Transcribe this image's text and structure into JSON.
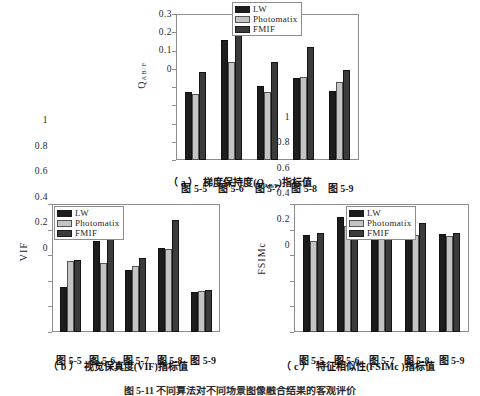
{
  "figure": {
    "bottom_caption": "图 5-11   不同算法对不同场景图像融合结果的客观评价"
  },
  "series": [
    {
      "name": "LW",
      "color": "#1d1d1d"
    },
    {
      "name": "Photomatix",
      "color": "#c4c4c4"
    },
    {
      "name": "FMIF",
      "color": "#3b3b3b"
    }
  ],
  "categories": [
    "图 5-5",
    "图 5-6",
    "图 5-7",
    "图 5-8",
    "图 5-9"
  ],
  "chart_data": [
    {
      "type": "bar",
      "id": "a",
      "panel_label": "（ a ）",
      "caption": "梯度保持度(Q AB/F )指标值",
      "caption_plain": "（ a ）  梯度保持度(Q_AB/F)指标值",
      "ylabel": "Q",
      "ylabel_sub": "AB/F",
      "xlabel": "",
      "ylim": [
        0,
        0.8
      ],
      "yticks": [
        0,
        0.1,
        0.2,
        0.3,
        0.4,
        0.5,
        0.6,
        0.7,
        0.8
      ],
      "ytick_labels": [
        "0",
        "0.1",
        "0.2",
        "0.3",
        "0.4",
        "0.5",
        "0.6",
        "0.7",
        "0.8"
      ],
      "grid": false,
      "legend_position": "top-right",
      "categories": [
        "图 5-5",
        "图 5-6",
        "图 5-7",
        "图 5-8",
        "图 5-9"
      ],
      "series": [
        {
          "name": "LW",
          "values": [
            0.375,
            0.655,
            0.405,
            0.45,
            0.38
          ]
        },
        {
          "name": "Photomatix",
          "values": [
            0.363,
            0.538,
            0.373,
            0.455,
            0.425
          ]
        },
        {
          "name": "FMIF",
          "values": [
            0.483,
            0.777,
            0.537,
            0.62,
            0.495
          ]
        }
      ]
    },
    {
      "type": "bar",
      "id": "b",
      "panel_label": "（ b ）",
      "caption": "视觉保真度(VIF)指标值",
      "caption_plain": "（ b ）  视觉保真度(VIF)指标值",
      "ylabel": "VIF",
      "ylabel_sub": "",
      "xlabel": "",
      "ylim": [
        0,
        1
      ],
      "yticks": [
        0,
        0.2,
        0.4,
        0.6,
        0.8,
        1
      ],
      "ytick_labels": [
        "0",
        "0.2",
        "0.4",
        "0.6",
        "0.8",
        "1"
      ],
      "grid": false,
      "legend_position": "top-left",
      "categories": [
        "图 5-5",
        "图 5-6",
        "图 5-7",
        "图 5-8",
        "图 5-9"
      ],
      "series": [
        {
          "name": "LW",
          "values": [
            0.355,
            0.712,
            0.482,
            0.66,
            0.31
          ]
        },
        {
          "name": "Photomatix",
          "values": [
            0.558,
            0.54,
            0.515,
            0.648,
            0.318
          ]
        },
        {
          "name": "FMIF",
          "values": [
            0.562,
            0.787,
            0.582,
            0.872,
            0.332
          ]
        }
      ]
    },
    {
      "type": "bar",
      "id": "c",
      "panel_label": "（ c ）",
      "caption": "特征相似性(FSIMc )指标值",
      "caption_plain": "（ c ）  特征相似性(FSIMc )指标值",
      "ylabel": "FSIMc",
      "ylabel_sub": "",
      "xlabel": "",
      "ylim": [
        0,
        1
      ],
      "yticks": [
        0,
        0.2,
        0.4,
        0.6,
        0.8,
        1
      ],
      "ytick_labels": [
        "0",
        "0.2",
        "0.4",
        "0.6",
        "0.8",
        "1"
      ],
      "grid": false,
      "legend_position": "top-right",
      "categories": [
        "图 5-5",
        "图 5-6",
        "图 5-7",
        "图 5-8",
        "图 5-9"
      ],
      "series": [
        {
          "name": "LW",
          "values": [
            0.757,
            0.898,
            0.853,
            0.73,
            0.762
          ]
        },
        {
          "name": "Photomatix",
          "values": [
            0.712,
            0.825,
            0.785,
            0.758,
            0.752
          ]
        },
        {
          "name": "FMIF",
          "values": [
            0.773,
            0.98,
            0.882,
            0.855,
            0.775
          ]
        }
      ]
    }
  ]
}
